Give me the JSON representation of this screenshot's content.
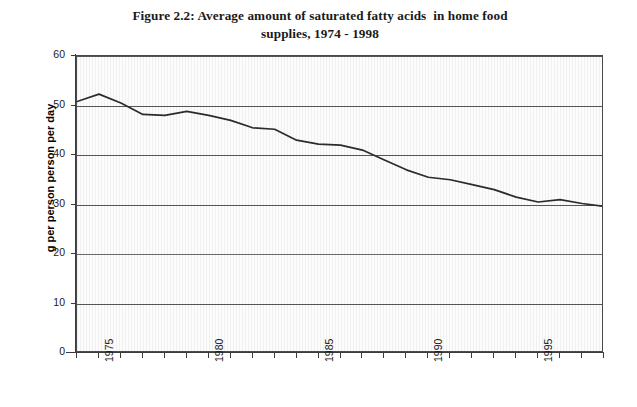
{
  "document": {
    "figure_label": "Figure 2.2:",
    "title_line_1": "Figure 2.2: Average amount of saturated fatty acids  in home food",
    "title_line_2": "supplies, 1974 - 1998"
  },
  "axes": {
    "y_title": "g per person person per day",
    "y_ticks": [
      "0",
      "10",
      "20",
      "30",
      "40",
      "50",
      "60"
    ],
    "x_tick_labels": [
      "1975",
      "1980",
      "1985",
      "1990",
      "1995"
    ]
  },
  "chart_data": {
    "type": "line",
    "title": "Figure 2.2: Average amount of saturated fatty acids  in home food supplies, 1974 - 1998",
    "xlabel": "",
    "ylabel": "g per person person per day",
    "ylim": [
      0,
      60
    ],
    "xlim": [
      1974,
      1998
    ],
    "ytick_values": [
      0,
      10,
      20,
      30,
      40,
      50,
      60
    ],
    "xtick_values": [
      1974,
      1975,
      1976,
      1977,
      1978,
      1979,
      1980,
      1981,
      1982,
      1983,
      1984,
      1985,
      1986,
      1987,
      1988,
      1989,
      1990,
      1991,
      1992,
      1993,
      1994,
      1995,
      1996,
      1997,
      1998
    ],
    "xtick_labeled": [
      1975,
      1980,
      1985,
      1990,
      1995
    ],
    "grid": "horizontal",
    "legend": "none",
    "x": [
      1974,
      1975,
      1976,
      1977,
      1978,
      1979,
      1980,
      1981,
      1982,
      1983,
      1984,
      1985,
      1986,
      1987,
      1988,
      1989,
      1990,
      1991,
      1992,
      1993,
      1994,
      1995,
      1996,
      1997,
      1998
    ],
    "values": [
      50.8,
      52.3,
      50.5,
      48.2,
      48.0,
      48.8,
      48.0,
      47.0,
      45.5,
      45.2,
      43.0,
      42.2,
      42.0,
      41.0,
      39.0,
      37.0,
      35.5,
      35.0,
      34.0,
      33.0,
      31.5,
      30.5,
      31.0,
      30.2,
      29.6
    ],
    "series": [
      {
        "name": "Saturated fatty acids",
        "color": "#2b2b2b",
        "values": [
          50.8,
          52.3,
          50.5,
          48.2,
          48.0,
          48.8,
          48.0,
          47.0,
          45.5,
          45.2,
          43.0,
          42.2,
          42.0,
          41.0,
          39.0,
          37.0,
          35.5,
          35.0,
          34.0,
          33.0,
          31.5,
          30.5,
          31.0,
          30.2,
          29.6
        ]
      }
    ]
  },
  "colors": {
    "line": "#2b2b2b",
    "gridline": "#555555",
    "axis": "#3c3c3c",
    "plot_background": "#fcfcfc",
    "page_background": "#ffffff",
    "text": "#1a1a1a"
  }
}
